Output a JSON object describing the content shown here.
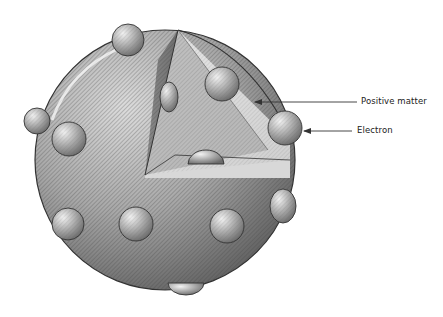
{
  "diagram": {
    "labels": [
      {
        "id": "positive-matter",
        "text": "Positive matter"
      },
      {
        "id": "electron",
        "text": "Electron"
      }
    ],
    "colors": {
      "sphere_light": "#d4d4d4",
      "sphere_mid": "#9c9c9c",
      "sphere_dark": "#5e5e5e",
      "cut_face_light": "#e6e6e6",
      "cut_face_dark": "#7a7a7a",
      "arrow": "#333333"
    }
  }
}
